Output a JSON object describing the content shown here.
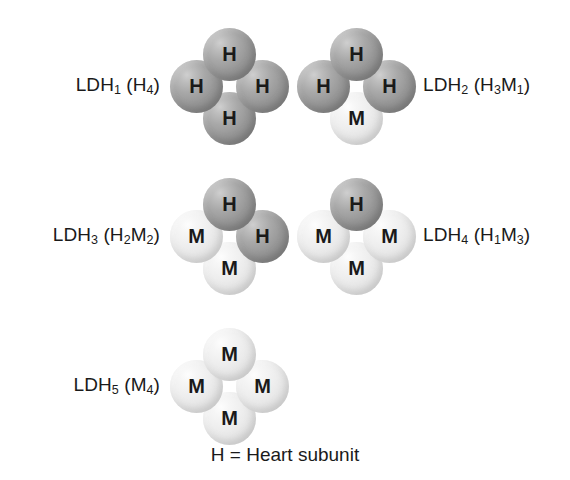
{
  "diagram": {
    "caption": "H = Heart subunit",
    "subunit_colors": {
      "H": "#989898",
      "M": "#e8e8e8"
    },
    "rows": [
      {
        "isozymes": [
          {
            "name": "LDH1",
            "label_prefix": "LDH",
            "label_index": "1",
            "label_open": " (H",
            "label_sub1": "4",
            "label_close": ")",
            "label_plain": "LDH1 (H4)",
            "subunits": {
              "top": "H",
              "left": "H",
              "right": "H",
              "bottom": "H"
            }
          },
          {
            "name": "LDH2",
            "label_prefix": "LDH",
            "label_index": "2",
            "label_open": " (H",
            "label_sub1": "3",
            "label_mid": "M",
            "label_sub2": "1",
            "label_close": ")",
            "label_plain": "LDH2 (H3M1)",
            "subunits": {
              "top": "H",
              "left": "H",
              "right": "H",
              "bottom": "M"
            }
          }
        ]
      },
      {
        "isozymes": [
          {
            "name": "LDH3",
            "label_prefix": "LDH",
            "label_index": "3",
            "label_open": " (H",
            "label_sub1": "2",
            "label_mid": "M",
            "label_sub2": "2",
            "label_close": ")",
            "label_plain": "LDH3 (H2M2)",
            "subunits": {
              "top": "H",
              "left": "M",
              "right": "H",
              "bottom": "M"
            }
          },
          {
            "name": "LDH4",
            "label_prefix": "LDH",
            "label_index": "4",
            "label_open": " (H",
            "label_sub1": "1",
            "label_mid": "M",
            "label_sub2": "3",
            "label_close": ")",
            "label_plain": "LDH4 (H1M3)",
            "subunits": {
              "top": "H",
              "left": "M",
              "right": "M",
              "bottom": "M"
            }
          }
        ]
      },
      {
        "isozymes": [
          {
            "name": "LDH5",
            "label_prefix": "LDH",
            "label_index": "5",
            "label_open": " (M",
            "label_sub1": "4",
            "label_close": ")",
            "label_plain": "LDH5 (M4)",
            "subunits": {
              "top": "M",
              "left": "M",
              "right": "M",
              "bottom": "M"
            }
          }
        ]
      }
    ]
  }
}
